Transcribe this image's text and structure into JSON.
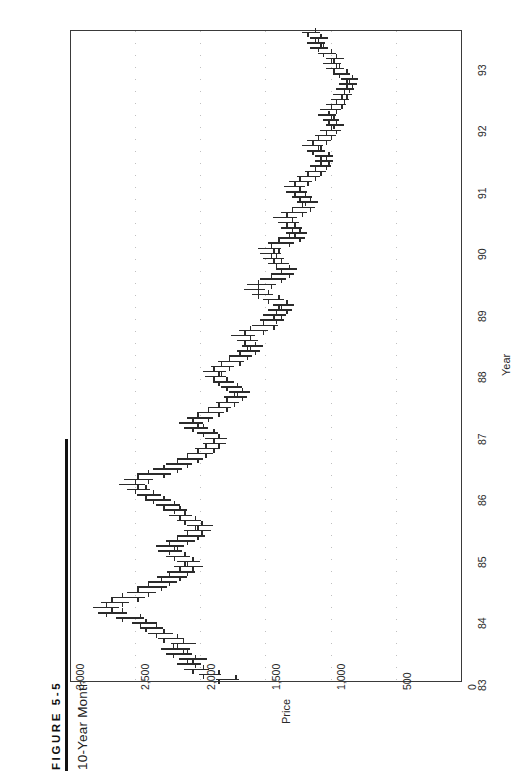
{
  "figure": {
    "number_label": "FIGURE  5-5",
    "title": "10-Year Monthly Cocoa Chart"
  },
  "chart_data": {
    "type": "bar",
    "subtype": "ohlc-bar",
    "orientation": "rotated-90ccw",
    "title": "10-Year Monthly Cocoa Chart",
    "xlabel": "Year",
    "ylabel": "Price",
    "grid": true,
    "legend": null,
    "xlim": [
      1983.0,
      1993.6
    ],
    "ylim": [
      0,
      3000
    ],
    "xticks": [
      "83",
      "84",
      "85",
      "86",
      "87",
      "88",
      "89",
      "90",
      "91",
      "92",
      "93"
    ],
    "xtick_values": [
      1983,
      1984,
      1985,
      1986,
      1987,
      1988,
      1989,
      1990,
      1991,
      1992,
      1993
    ],
    "yticks": [
      "3,000",
      "2,500",
      "2,000",
      "1,500",
      "1,000",
      "500",
      "0"
    ],
    "ytick_values": [
      3000,
      2500,
      2000,
      1500,
      1000,
      500,
      0
    ],
    "gridline_values": [
      2500,
      2000,
      1500,
      1000,
      500
    ],
    "series_name": "Cocoa monthly OHLC",
    "categories": [
      "1983-01",
      "1983-02",
      "1983-03",
      "1983-04",
      "1983-05",
      "1983-06",
      "1983-07",
      "1983-08",
      "1983-09",
      "1983-10",
      "1983-11",
      "1983-12",
      "1984-01",
      "1984-02",
      "1984-03",
      "1984-04",
      "1984-05",
      "1984-06",
      "1984-07",
      "1984-08",
      "1984-09",
      "1984-10",
      "1984-11",
      "1984-12",
      "1985-01",
      "1985-02",
      "1985-03",
      "1985-04",
      "1985-05",
      "1985-06",
      "1985-07",
      "1985-08",
      "1985-09",
      "1985-10",
      "1985-11",
      "1985-12",
      "1986-01",
      "1986-02",
      "1986-03",
      "1986-04",
      "1986-05",
      "1986-06",
      "1986-07",
      "1986-08",
      "1986-09",
      "1986-10",
      "1986-11",
      "1986-12",
      "1987-01",
      "1987-02",
      "1987-03",
      "1987-04",
      "1987-05",
      "1987-06",
      "1987-07",
      "1987-08",
      "1987-09",
      "1987-10",
      "1987-11",
      "1987-12",
      "1988-01",
      "1988-02",
      "1988-03",
      "1988-04",
      "1988-05",
      "1988-06",
      "1988-07",
      "1988-08",
      "1988-09",
      "1988-10",
      "1988-11",
      "1988-12",
      "1989-01",
      "1989-02",
      "1989-03",
      "1989-04",
      "1989-05",
      "1989-06",
      "1989-07",
      "1989-08",
      "1989-09",
      "1989-10",
      "1989-11",
      "1989-12",
      "1990-01",
      "1990-02",
      "1990-03",
      "1990-04",
      "1990-05",
      "1990-06",
      "1990-07",
      "1990-08",
      "1990-09",
      "1990-10",
      "1990-11",
      "1990-12",
      "1991-01",
      "1991-02",
      "1991-03",
      "1991-04",
      "1991-05",
      "1991-06",
      "1991-07",
      "1991-08",
      "1991-09",
      "1991-10",
      "1991-11",
      "1991-12",
      "1992-01",
      "1992-02",
      "1992-03",
      "1992-04",
      "1992-05",
      "1992-06",
      "1992-07",
      "1992-08",
      "1992-09",
      "1992-10",
      "1992-11",
      "1992-12",
      "1993-01",
      "1993-02",
      "1993-03",
      "1993-04",
      "1993-05",
      "1993-06",
      "1993-07"
    ],
    "ohlc": [
      [
        1730,
        1880,
        1700,
        1860
      ],
      [
        1860,
        2010,
        1840,
        1980
      ],
      [
        1980,
        2120,
        1930,
        2060
      ],
      [
        2060,
        2180,
        1990,
        2040
      ],
      [
        2040,
        2160,
        1950,
        2100
      ],
      [
        2100,
        2260,
        2060,
        2210
      ],
      [
        2210,
        2300,
        2080,
        2130
      ],
      [
        2130,
        2220,
        2030,
        2180
      ],
      [
        2180,
        2320,
        2120,
        2280
      ],
      [
        2280,
        2400,
        2210,
        2340
      ],
      [
        2340,
        2460,
        2280,
        2420
      ],
      [
        2420,
        2520,
        2330,
        2460
      ],
      [
        2460,
        2640,
        2430,
        2600
      ],
      [
        2600,
        2780,
        2560,
        2720
      ],
      [
        2720,
        2820,
        2620,
        2680
      ],
      [
        2680,
        2760,
        2540,
        2600
      ],
      [
        2600,
        2680,
        2420,
        2480
      ],
      [
        2480,
        2560,
        2340,
        2400
      ],
      [
        2400,
        2480,
        2250,
        2300
      ],
      [
        2300,
        2400,
        2180,
        2240
      ],
      [
        2240,
        2330,
        2100,
        2160
      ],
      [
        2160,
        2250,
        2040,
        2100
      ],
      [
        2100,
        2200,
        1980,
        2060
      ],
      [
        2060,
        2180,
        2000,
        2120
      ],
      [
        2120,
        2260,
        2080,
        2200
      ],
      [
        2200,
        2320,
        2140,
        2240
      ],
      [
        2240,
        2340,
        2120,
        2180
      ],
      [
        2180,
        2260,
        2040,
        2100
      ],
      [
        2100,
        2180,
        1960,
        2020
      ],
      [
        2020,
        2120,
        1920,
        1990
      ],
      [
        1990,
        2100,
        1900,
        2040
      ],
      [
        2040,
        2180,
        1990,
        2120
      ],
      [
        2120,
        2240,
        2060,
        2160
      ],
      [
        2160,
        2280,
        2100,
        2200
      ],
      [
        2200,
        2340,
        2150,
        2280
      ],
      [
        2280,
        2420,
        2220,
        2360
      ],
      [
        2360,
        2480,
        2300,
        2420
      ],
      [
        2420,
        2560,
        2380,
        2500
      ],
      [
        2500,
        2620,
        2420,
        2480
      ],
      [
        2480,
        2580,
        2360,
        2400
      ],
      [
        2400,
        2480,
        2220,
        2280
      ],
      [
        2280,
        2360,
        2140,
        2180
      ],
      [
        2180,
        2260,
        2060,
        2100
      ],
      [
        2100,
        2180,
        1980,
        2020
      ],
      [
        2020,
        2100,
        1900,
        1960
      ],
      [
        1960,
        2040,
        1850,
        1900
      ],
      [
        1900,
        1980,
        1800,
        1860
      ],
      [
        1860,
        1960,
        1790,
        1900
      ],
      [
        1900,
        2020,
        1860,
        1980
      ],
      [
        1980,
        2120,
        1940,
        2060
      ],
      [
        2060,
        2160,
        1980,
        2020
      ],
      [
        2020,
        2100,
        1900,
        1940
      ],
      [
        1940,
        2020,
        1820,
        1860
      ],
      [
        1860,
        1940,
        1760,
        1800
      ],
      [
        1800,
        1880,
        1700,
        1740
      ],
      [
        1740,
        1820,
        1640,
        1680
      ],
      [
        1680,
        1780,
        1620,
        1720
      ],
      [
        1720,
        1840,
        1680,
        1800
      ],
      [
        1800,
        1900,
        1740,
        1860
      ],
      [
        1860,
        1960,
        1800,
        1900
      ],
      [
        1900,
        1980,
        1800,
        1840
      ],
      [
        1840,
        1920,
        1740,
        1780
      ],
      [
        1780,
        1860,
        1660,
        1700
      ],
      [
        1700,
        1780,
        1600,
        1640
      ],
      [
        1640,
        1720,
        1540,
        1580
      ],
      [
        1580,
        1680,
        1520,
        1620
      ],
      [
        1620,
        1720,
        1560,
        1660
      ],
      [
        1660,
        1760,
        1580,
        1620
      ],
      [
        1620,
        1700,
        1480,
        1520
      ],
      [
        1520,
        1600,
        1400,
        1440
      ],
      [
        1440,
        1540,
        1360,
        1420
      ],
      [
        1420,
        1520,
        1340,
        1380
      ],
      [
        1380,
        1480,
        1300,
        1340
      ],
      [
        1340,
        1440,
        1280,
        1400
      ],
      [
        1400,
        1520,
        1360,
        1480
      ],
      [
        1480,
        1600,
        1440,
        1560
      ],
      [
        1560,
        1660,
        1500,
        1560
      ],
      [
        1560,
        1640,
        1420,
        1460
      ],
      [
        1460,
        1540,
        1340,
        1380
      ],
      [
        1380,
        1460,
        1280,
        1320
      ],
      [
        1320,
        1420,
        1260,
        1380
      ],
      [
        1380,
        1480,
        1320,
        1420
      ],
      [
        1420,
        1520,
        1360,
        1440
      ],
      [
        1440,
        1540,
        1380,
        1460
      ],
      [
        1460,
        1560,
        1380,
        1400
      ],
      [
        1400,
        1480,
        1280,
        1320
      ],
      [
        1320,
        1400,
        1200,
        1240
      ],
      [
        1240,
        1340,
        1180,
        1280
      ],
      [
        1280,
        1380,
        1220,
        1300
      ],
      [
        1300,
        1400,
        1240,
        1340
      ],
      [
        1340,
        1440,
        1260,
        1300
      ],
      [
        1300,
        1380,
        1180,
        1220
      ],
      [
        1220,
        1300,
        1120,
        1160
      ],
      [
        1160,
        1260,
        1100,
        1200
      ],
      [
        1200,
        1300,
        1140,
        1240
      ],
      [
        1240,
        1340,
        1180,
        1280
      ],
      [
        1280,
        1360,
        1200,
        1240
      ],
      [
        1240,
        1320,
        1140,
        1180
      ],
      [
        1180,
        1260,
        1080,
        1120
      ],
      [
        1120,
        1200,
        1040,
        1080
      ],
      [
        1080,
        1160,
        1000,
        1040
      ],
      [
        1040,
        1120,
        980,
        1020
      ],
      [
        1020,
        1120,
        980,
        1080
      ],
      [
        1080,
        1180,
        1040,
        1140
      ],
      [
        1140,
        1220,
        1060,
        1100
      ],
      [
        1100,
        1180,
        1000,
        1040
      ],
      [
        1040,
        1120,
        960,
        1000
      ],
      [
        1000,
        1080,
        920,
        960
      ],
      [
        960,
        1040,
        900,
        980
      ],
      [
        980,
        1060,
        940,
        1020
      ],
      [
        1020,
        1100,
        960,
        1000
      ],
      [
        1000,
        1080,
        920,
        960
      ],
      [
        960,
        1040,
        880,
        920
      ],
      [
        920,
        1000,
        860,
        900
      ],
      [
        900,
        980,
        840,
        880
      ],
      [
        880,
        960,
        820,
        860
      ],
      [
        860,
        940,
        800,
        840
      ],
      [
        840,
        920,
        790,
        880
      ],
      [
        880,
        980,
        850,
        940
      ],
      [
        940,
        1040,
        900,
        980
      ],
      [
        980,
        1060,
        920,
        960
      ],
      [
        960,
        1040,
        900,
        1000
      ],
      [
        1000,
        1100,
        960,
        1060
      ],
      [
        1060,
        1160,
        1020,
        1100
      ],
      [
        1100,
        1180,
        1040,
        1080
      ],
      [
        1080,
        1160,
        1020,
        1120
      ],
      [
        1120,
        1220,
        1080,
        1180
      ]
    ]
  }
}
